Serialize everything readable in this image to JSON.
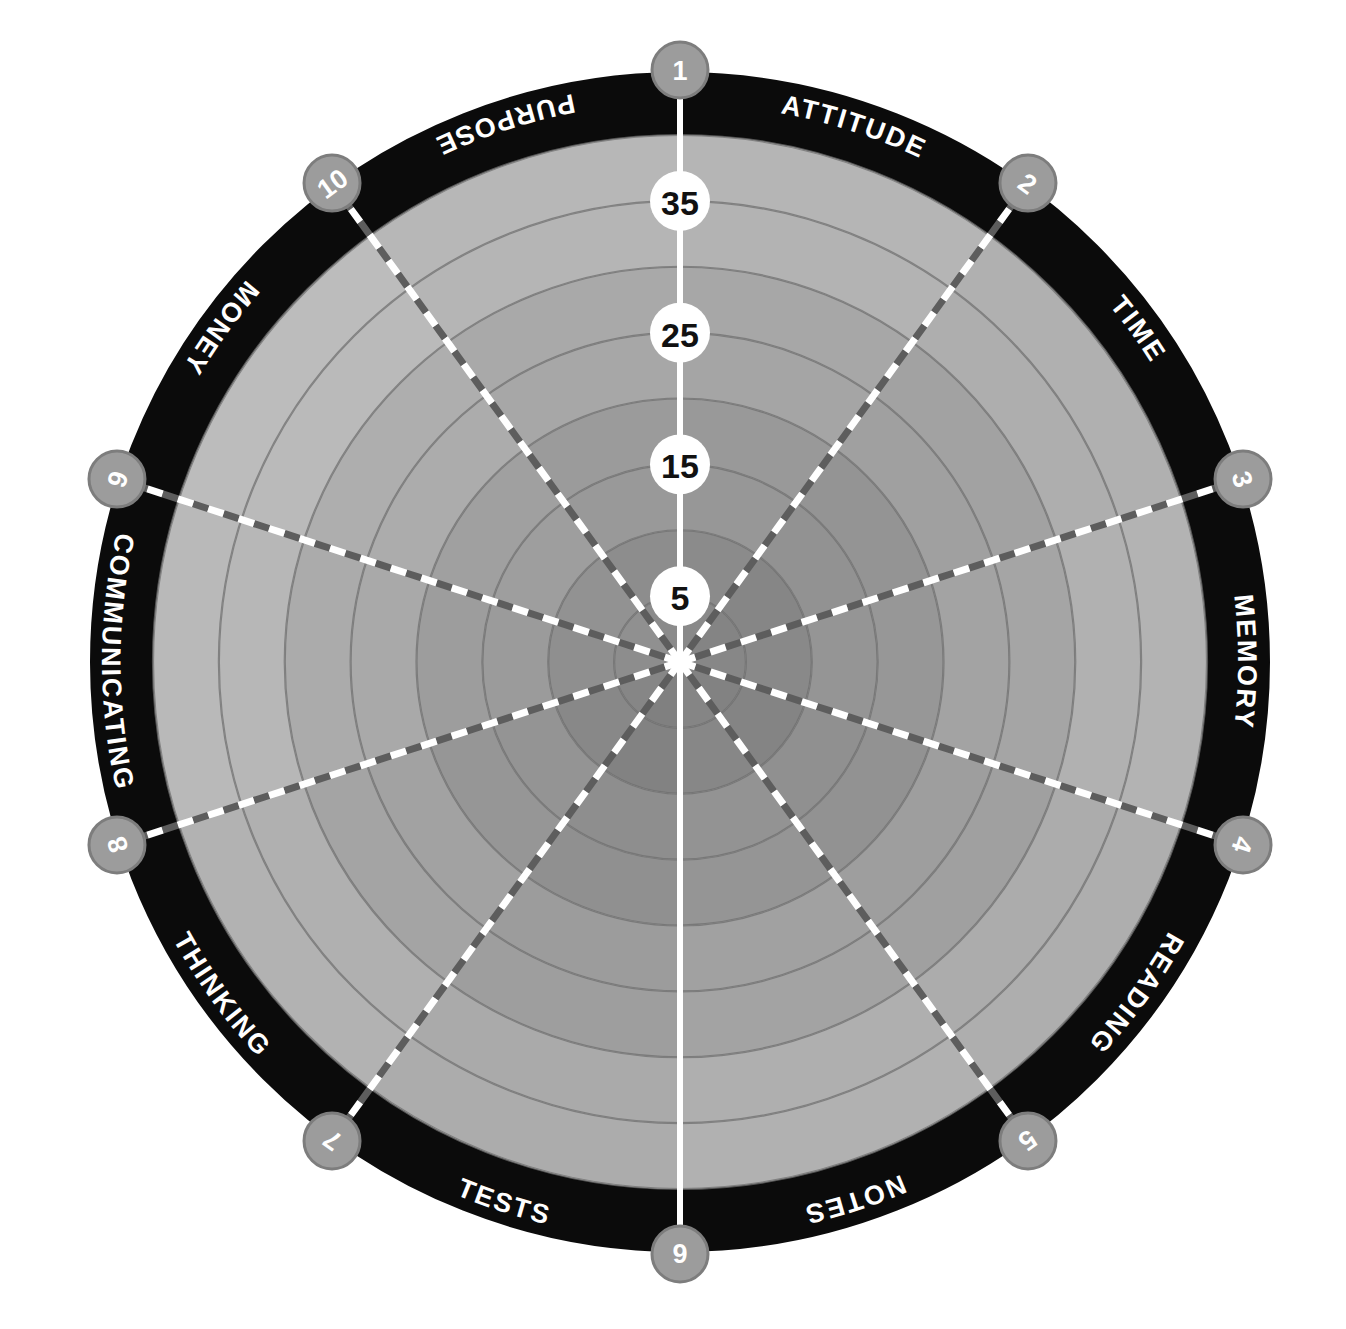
{
  "chart_data": {
    "type": "radar",
    "title": "",
    "subtitle": "",
    "xlabel": "",
    "ylabel": "",
    "grid": true,
    "legend_position": "none",
    "axis_range": [
      0,
      40
    ],
    "ring_step": 5,
    "ring_count": 8,
    "scale_labels": [
      "5",
      "15",
      "25",
      "35"
    ],
    "scale_label_values": [
      5,
      15,
      25,
      35
    ],
    "categories": [
      "ATTITUDE",
      "TIME",
      "MEMORY",
      "READING",
      "NOTES",
      "TESTS",
      "THINKING",
      "COMMUNICATING",
      "MONEY",
      "PURPOSE"
    ],
    "category_numbers": [
      "1",
      "2",
      "3",
      "4",
      "5",
      "6",
      "7",
      "8",
      "9",
      "10"
    ],
    "values": [
      null,
      null,
      null,
      null,
      null,
      null,
      null,
      null,
      null,
      null
    ],
    "series": []
  },
  "wheel": {
    "sectors": [
      {
        "number": "1",
        "label": "ATTITUDE"
      },
      {
        "number": "2",
        "label": "TIME"
      },
      {
        "number": "3",
        "label": "MEMORY"
      },
      {
        "number": "4",
        "label": "READING"
      },
      {
        "number": "5",
        "label": "NOTES"
      },
      {
        "number": "6",
        "label": "TESTS"
      },
      {
        "number": "7",
        "label": "THINKING"
      },
      {
        "number": "8",
        "label": "COMMUNICATING"
      },
      {
        "number": "9",
        "label": "MONEY"
      },
      {
        "number": "10",
        "label": "PURPOSE"
      }
    ],
    "scale": [
      {
        "value": "35"
      },
      {
        "value": "25"
      },
      {
        "value": "15"
      },
      {
        "value": "5"
      }
    ]
  },
  "colors": {
    "page_background": "#ffffff",
    "outer_ring": "#0b0b0b",
    "badge_fill": "#9c9c9c",
    "badge_stroke": "#7d7d7d",
    "badge_text": "#ffffff",
    "sector_label_text": "#ffffff",
    "scale_circle_fill": "#ffffff",
    "scale_text": "#141414",
    "axis_line": "#ffffff",
    "spoke_dash_light": "#ffffff",
    "spoke_dash_dark": "#5d5d5d",
    "ring_divider": "#6f6f6f",
    "hub": "#ffffff",
    "plot_light": "#c0c0c0",
    "plot_mid": "#ababab",
    "plot_dark": "#8e8e8e"
  }
}
